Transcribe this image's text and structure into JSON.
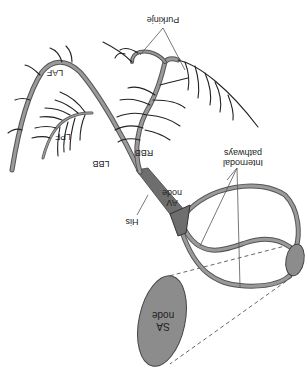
{
  "diagram": {
    "orientation": "rotated 180 degrees",
    "labels": {
      "purkinje": "Purkinje",
      "laf": "LAF",
      "lpf": "LPF",
      "lbb": "LBB",
      "rbb": "RBB",
      "internodal_line1": "Internodal",
      "internodal_line2": "pathways",
      "av_line1": "AV",
      "av_line2": "node",
      "his": "His",
      "sa_line1": "SA",
      "sa_line2": "node"
    },
    "colors": {
      "fiber_outline": "#555555",
      "fiber_fill": "#9a9a9a",
      "node_fill": "#8c8c8c",
      "av_node_fill": "#6e6e6e",
      "text": "#222222",
      "background": "#ffffff"
    }
  }
}
